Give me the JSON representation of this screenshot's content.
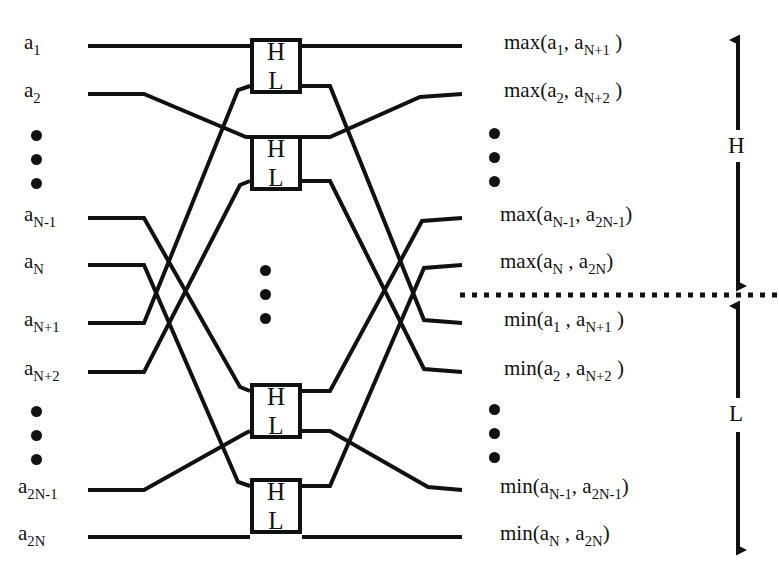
{
  "figure": {
    "type": "diagram",
    "stroke_color": "#111111",
    "background_color": "#ffffff"
  },
  "inputs": [
    {
      "id": "in-1",
      "base": "a",
      "sub": "1",
      "label": "a1",
      "y": 46
    },
    {
      "id": "in-2",
      "base": "a",
      "sub": "2",
      "label": "a2",
      "y": 94
    },
    {
      "id": "in-Nm1",
      "base": "a",
      "sub": "N-1",
      "label": "aN-1",
      "y": 218
    },
    {
      "id": "in-N",
      "base": "a",
      "sub": "N",
      "label": "aN",
      "y": 265
    },
    {
      "id": "in-Np1",
      "base": "a",
      "sub": "N+1",
      "label": "aN+1",
      "y": 323
    },
    {
      "id": "in-Np2",
      "base": "a",
      "sub": "N+2",
      "label": "aN+2",
      "y": 372
    },
    {
      "id": "in-2Nm1",
      "base": "a",
      "sub": "2N-1",
      "label": "a2N-1",
      "y": 490
    },
    {
      "id": "in-2N",
      "base": "a",
      "sub": "2N",
      "label": "a2N",
      "y": 537
    }
  ],
  "outputs": [
    {
      "id": "out-max-1",
      "fn": "max",
      "arg1_sub": "1",
      "arg2_sub": "N+1",
      "text": "max(a1, aN+1)",
      "y": 46
    },
    {
      "id": "out-max-2",
      "fn": "max",
      "arg1_sub": "2",
      "arg2_sub": "N+2",
      "text": "max(a2, aN+2)",
      "y": 94
    },
    {
      "id": "out-max-Nm1",
      "fn": "max",
      "arg1_sub": "N-1",
      "arg2_sub": "2N-1",
      "text": "max(aN-1, a2N-1)",
      "y": 218
    },
    {
      "id": "out-max-N",
      "fn": "max",
      "arg1_sub": "N",
      "arg2_sub": "2N",
      "text": "max(aN, a2N)",
      "y": 265
    },
    {
      "id": "out-min-1",
      "fn": "min",
      "arg1_sub": "1",
      "arg2_sub": "N+1",
      "text": "min(a1, aN+1)",
      "y": 323
    },
    {
      "id": "out-min-2",
      "fn": "min",
      "arg1_sub": "2",
      "arg2_sub": "N+2",
      "text": "min(a2, aN+2)",
      "y": 372
    },
    {
      "id": "out-min-Nm1",
      "fn": "min",
      "arg1_sub": "N-1",
      "arg2_sub": "2N-1",
      "text": "min(aN-1, a2N-1)",
      "y": 490
    },
    {
      "id": "out-min-N",
      "fn": "min",
      "arg1_sub": "N",
      "arg2_sub": "2N",
      "text": "min(aN, a2N)",
      "y": 537
    }
  ],
  "comparator_boxes": [
    {
      "id": "box-1",
      "upper_label": "H",
      "lower_label": "L",
      "x": 250,
      "y": 38,
      "w": 52,
      "h": 56
    },
    {
      "id": "box-2",
      "upper_label": "H",
      "lower_label": "L",
      "x": 250,
      "y": 135,
      "w": 52,
      "h": 56
    },
    {
      "id": "box-3",
      "upper_label": "H",
      "lower_label": "L",
      "x": 250,
      "y": 383,
      "w": 52,
      "h": 56
    },
    {
      "id": "box-4",
      "upper_label": "H",
      "lower_label": "L",
      "x": 250,
      "y": 478,
      "w": 52,
      "h": 56
    }
  ],
  "ellipses": [
    {
      "id": "input-ellipsis-upper",
      "dots": 3,
      "x": 31,
      "y": 130
    },
    {
      "id": "input-ellipsis-lower",
      "dots": 3,
      "x": 31,
      "y": 406
    },
    {
      "id": "center-ellipsis",
      "dots": 3,
      "x": 260,
      "y": 265
    },
    {
      "id": "output-ellipsis-upper",
      "dots": 3,
      "x": 489,
      "y": 128
    },
    {
      "id": "output-ellipsis-lower",
      "dots": 3,
      "x": 489,
      "y": 404
    }
  ],
  "dividers": [
    {
      "id": "hl-divider",
      "style": "dotted",
      "y": 295,
      "x_start": 460,
      "x_end": 779
    }
  ],
  "range_brackets": [
    {
      "id": "bracket-H",
      "label": "H",
      "x": 734,
      "y_top": 34,
      "y_bottom": 290,
      "label_y": 146
    },
    {
      "id": "bracket-L",
      "label": "L",
      "x": 734,
      "y_top": 300,
      "y_bottom": 556,
      "label_y": 415
    }
  ]
}
